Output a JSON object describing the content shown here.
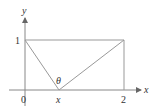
{
  "diagram": {
    "axes": {
      "x_label": "x",
      "y_label": "y",
      "origin_label": "0"
    },
    "ticks": {
      "y_one": "1",
      "x_two": "2",
      "x_point": "x"
    },
    "angle_label": "θ",
    "colors": {
      "axis": "#888888",
      "shape": "#999999",
      "text": "#333333"
    },
    "shapes": {
      "rectangle": {
        "x_from": 0,
        "x_to": 2,
        "y_from": 0,
        "y_to": 1
      },
      "lines": [
        {
          "from": [
            0,
            1
          ],
          "to": [
            "x",
            0
          ]
        },
        {
          "from": [
            "x",
            0
          ],
          "to": [
            2,
            1
          ]
        }
      ]
    }
  }
}
